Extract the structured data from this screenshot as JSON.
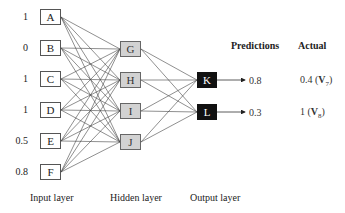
{
  "diagram": {
    "type": "feedforward-neural-network",
    "input_layer": {
      "label": "Input layer",
      "nodes": [
        {
          "id": "A",
          "value": "1"
        },
        {
          "id": "B",
          "value": "0"
        },
        {
          "id": "C",
          "value": "1"
        },
        {
          "id": "D",
          "value": "1"
        },
        {
          "id": "E",
          "value": "0.5"
        },
        {
          "id": "F",
          "value": "0.8"
        }
      ]
    },
    "hidden_layer": {
      "label": "Hidden layer",
      "nodes": [
        {
          "id": "G"
        },
        {
          "id": "H"
        },
        {
          "id": "I"
        },
        {
          "id": "J"
        }
      ]
    },
    "output_layer": {
      "label": "Output layer",
      "nodes": [
        {
          "id": "K",
          "prediction": "0.8",
          "actual": "0.4",
          "actual_var": "V",
          "actual_sub": "7"
        },
        {
          "id": "L",
          "prediction": "0.3",
          "actual": "1",
          "actual_var": "V",
          "actual_sub": "8"
        }
      ]
    },
    "headers": {
      "predictions": "Predictions",
      "actual": "Actual"
    },
    "connections": "fully connected between adjacent layers",
    "colors": {
      "input_fill": "#ffffff",
      "hidden_fill": "#d2d2d2",
      "output_fill": "#111111",
      "edge": "#444444"
    }
  }
}
